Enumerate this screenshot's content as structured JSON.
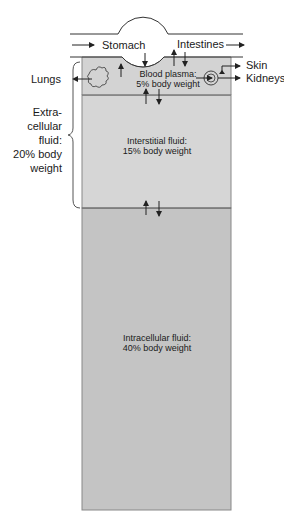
{
  "diagram": {
    "labels": {
      "stomach": "Stomach",
      "intestines": "Intestines",
      "lungs": "Lungs",
      "skin": "Skin",
      "kidneys": "Kidneys",
      "extracellular": [
        "Extra-",
        "cellular",
        "fluid:",
        "20% body",
        "weight"
      ]
    },
    "compartments": [
      {
        "name": "Blood plasma:",
        "value": "5% body weight",
        "fill": "#d3d3d3"
      },
      {
        "name": "Interstitial fluid:",
        "value": "15% body weight",
        "fill": "#d6d6d6"
      },
      {
        "name": "Intracellular fluid:",
        "value": "40% body weight",
        "fill": "#c4c4c4"
      }
    ],
    "colors": {
      "line": "#444444",
      "border": "#666666",
      "background": "#ffffff"
    }
  }
}
